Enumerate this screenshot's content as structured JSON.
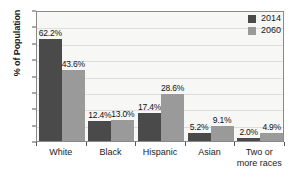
{
  "chart_data": {
    "type": "bar",
    "title": "",
    "xlabel": "",
    "ylabel": "% of Population",
    "ylim": [
      0,
      80
    ],
    "ytick_step": 10,
    "yticks": [
      "80",
      "70",
      "60",
      "50",
      "40",
      "30",
      "20",
      "10",
      "0"
    ],
    "grid": true,
    "legend_position": "top-right",
    "categories": [
      "White",
      "Black",
      "Hispanic",
      "Asian",
      "Two or more races"
    ],
    "category_lines": [
      [
        "White"
      ],
      [
        "Black"
      ],
      [
        "Hispanic"
      ],
      [
        "Asian"
      ],
      [
        "Two or",
        "more races"
      ]
    ],
    "series": [
      {
        "name": "2014",
        "color": "#4a4a4a",
        "values": [
          62.2,
          12.4,
          17.4,
          5.2,
          2.0
        ],
        "labels": [
          "62.2%",
          "12.4%",
          "17.4%",
          "5.2%",
          "2.0%"
        ]
      },
      {
        "name": "2060",
        "color": "#9a9a9a",
        "values": [
          43.6,
          13.0,
          28.6,
          9.1,
          4.9
        ],
        "labels": [
          "43.6%",
          "13.0%",
          "28.6%",
          "9.1%",
          "4.9%"
        ]
      }
    ]
  },
  "legend": {
    "items": [
      {
        "label": "2014",
        "color": "#4a4a4a"
      },
      {
        "label": "2060",
        "color": "#9a9a9a"
      }
    ]
  }
}
